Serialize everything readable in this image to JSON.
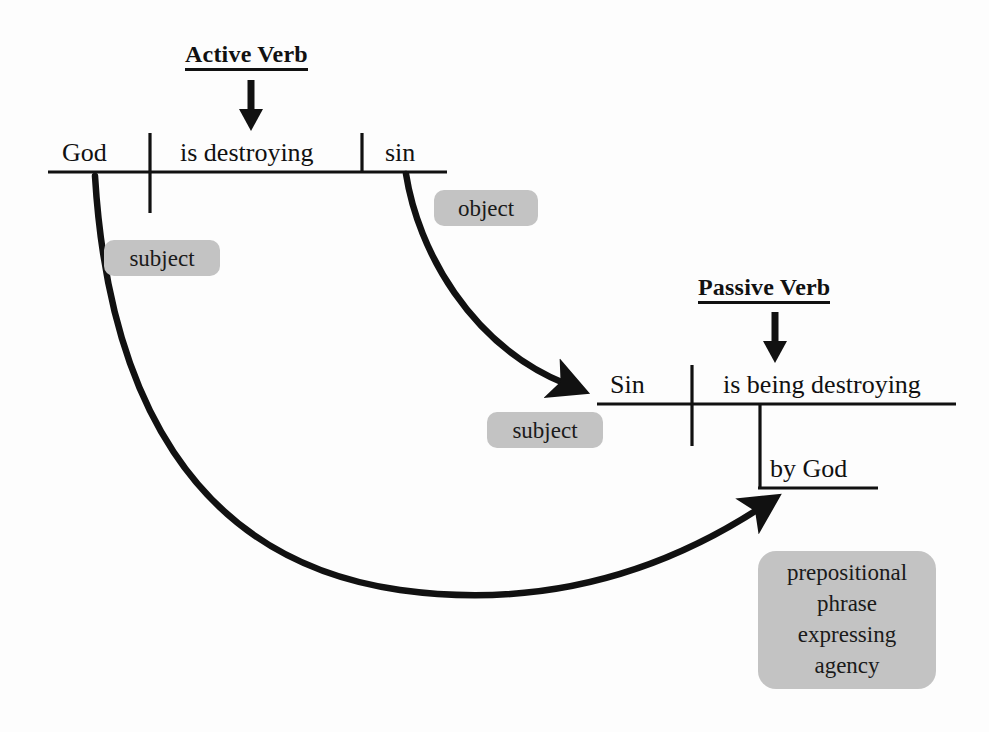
{
  "figure": {
    "kind": "sentence-diagram",
    "background_color": "#fdfdfd",
    "ink_color": "#111111",
    "pill_color": "#c3c3c3"
  },
  "active_clause": {
    "callout": "Active Verb",
    "subject": "God",
    "verb": "is destroying",
    "object": "sin"
  },
  "passive_clause": {
    "callout": "Passive Verb",
    "subject": "Sin",
    "verb": "is being destroying",
    "prep_phrase": "by God"
  },
  "annotations": {
    "subject_left": "subject",
    "object_right": "object",
    "subject_passive": "subject",
    "prep_line1": "prepositional",
    "prep_line2": "phrase",
    "prep_line3": "expressing",
    "prep_line4": "agency"
  },
  "icons": {
    "active_verb_arrow": "arrow-down-icon",
    "passive_verb_arrow": "arrow-down-icon",
    "object_transform_arrow": "curved-arrow-icon",
    "agency_transform_arrow": "curved-arrow-icon"
  }
}
